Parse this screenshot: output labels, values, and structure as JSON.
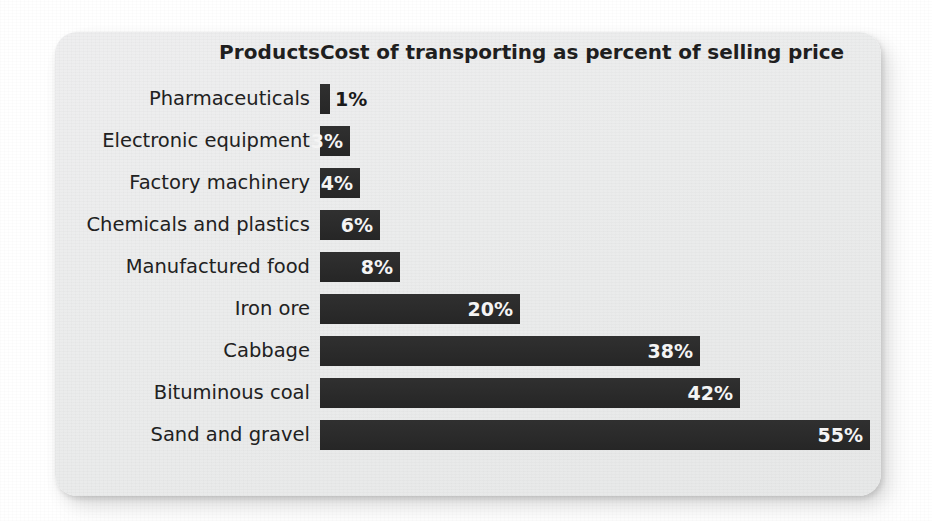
{
  "card": {
    "column_header_left": "Products",
    "column_header_right": "Cost of transporting as percent of selling price",
    "bar_color": "#2b2b2b",
    "card_background": "#ebecec",
    "inside_label_color": "#f4f4f4",
    "outside_label_color": "#1a1a1a"
  },
  "chart_data": {
    "type": "bar",
    "orientation": "horizontal",
    "title": "Cost of transporting as percent of selling price",
    "xlabel": "Cost of transporting as percent of selling price",
    "ylabel": "Products",
    "xlim": [
      0,
      55
    ],
    "grid": false,
    "legend": false,
    "value_suffix": "%",
    "categories": [
      "Pharmaceuticals",
      "Electronic equipment",
      "Factory machinery",
      "Chemicals and plastics",
      "Manufactured food",
      "Iron ore",
      "Cabbage",
      "Bituminous coal",
      "Sand and gravel"
    ],
    "values": [
      1,
      3,
      4,
      6,
      8,
      20,
      38,
      42,
      55
    ],
    "data_labels": [
      "1%",
      "3%",
      "4%",
      "6%",
      "8%",
      "20%",
      "38%",
      "42%",
      "55%"
    ],
    "label_placement": [
      "outside",
      "inside",
      "inside",
      "inside",
      "inside",
      "inside",
      "inside",
      "inside",
      "inside"
    ],
    "bars": [
      {
        "category": "Pharmaceuticals",
        "value": 1,
        "label": "1%",
        "placement": "outside"
      },
      {
        "category": "Electronic equipment",
        "value": 3,
        "label": "3%",
        "placement": "inside"
      },
      {
        "category": "Factory machinery",
        "value": 4,
        "label": "4%",
        "placement": "inside"
      },
      {
        "category": "Chemicals and plastics",
        "value": 6,
        "label": "6%",
        "placement": "inside"
      },
      {
        "category": "Manufactured food",
        "value": 8,
        "label": "8%",
        "placement": "inside"
      },
      {
        "category": "Iron ore",
        "value": 20,
        "label": "20%",
        "placement": "inside"
      },
      {
        "category": "Cabbage",
        "value": 38,
        "label": "38%",
        "placement": "inside"
      },
      {
        "category": "Bituminous coal",
        "value": 42,
        "label": "42%",
        "placement": "inside"
      },
      {
        "category": "Sand and gravel",
        "value": 55,
        "label": "55%",
        "placement": "inside"
      }
    ]
  }
}
